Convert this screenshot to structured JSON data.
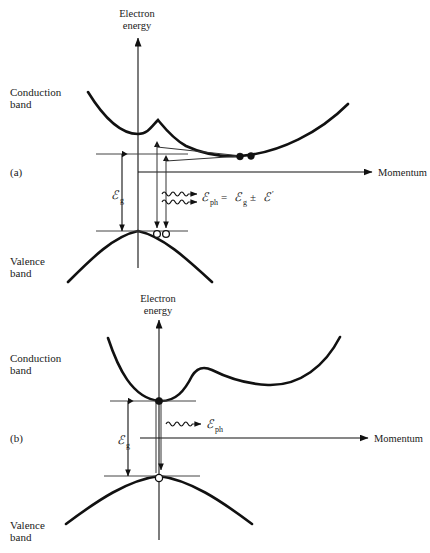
{
  "figure": {
    "background_color": "#ffffff",
    "line_color": "#111111",
    "panels": [
      {
        "id": "a",
        "panel_label": "(a)",
        "transition_type": "indirect",
        "axis": {
          "y_label_line1": "Electron",
          "y_label_line2": "energy",
          "x_label": "Momentum"
        },
        "band_labels": {
          "conduction_line1": "Conduction",
          "conduction_line2": "band",
          "valence_line1": "Valence",
          "valence_line2": "band"
        },
        "gap_label": {
          "symbol": "ℰ",
          "subscript": "g"
        },
        "equation": {
          "lhs_symbol": "ℰ",
          "lhs_subscript": "ph",
          "text": "ℰph = ℰg ± ℰ′",
          "parts": [
            "=",
            "ℰ",
            "g",
            "±",
            "ℰ",
            "′"
          ]
        },
        "markers": {
          "electrons": 2,
          "holes": 2,
          "phonon_arrows": 2
        }
      },
      {
        "id": "b",
        "panel_label": "(b)",
        "transition_type": "direct",
        "axis": {
          "y_label_line1": "Electron",
          "y_label_line2": "energy",
          "x_label": "Momentum"
        },
        "band_labels": {
          "conduction_line1": "Conduction",
          "conduction_line2": "band",
          "valence_line1": "Valence",
          "valence_line2": "band"
        },
        "gap_label": {
          "symbol": "ℰ",
          "subscript": "g"
        },
        "equation": {
          "lhs_symbol": "ℰ",
          "lhs_subscript": "ph",
          "text": "ℰph"
        },
        "markers": {
          "electrons": 1,
          "holes": 1,
          "phonon_arrows": 1
        }
      }
    ]
  }
}
